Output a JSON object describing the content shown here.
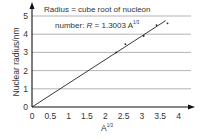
{
  "chart_data": {
    "type": "scatter",
    "title": "",
    "annotation_line1": "Radius = cube root of nucleon",
    "annotation_line2_prefix": "number: ",
    "annotation_var": "R",
    "annotation_eq": " = 1.3003 A",
    "annotation_sup": "1/3",
    "xlabel": "A",
    "xlabel_sup": "1/3",
    "ylabel": "Nuclear radius/nm",
    "xlim": [
      0,
      4
    ],
    "ylim": [
      0,
      5
    ],
    "xticks": [
      "0",
      "0.5",
      "1",
      "1.5",
      "2",
      "2.5",
      "3",
      "3.5",
      "4"
    ],
    "xtick_values": [
      0,
      0.5,
      1,
      1.5,
      2,
      2.5,
      3,
      3.5,
      4
    ],
    "yticks": [
      "0",
      "1",
      "2",
      "3",
      "4",
      "5"
    ],
    "ytick_values": [
      0,
      1,
      2,
      3,
      4,
      5
    ],
    "grid": "horizontal",
    "points": [
      {
        "x": 2.3,
        "y": 3.0
      },
      {
        "x": 2.55,
        "y": 3.45
      },
      {
        "x": 3.05,
        "y": 3.9
      },
      {
        "x": 3.4,
        "y": 4.5
      },
      {
        "x": 3.7,
        "y": 4.6
      }
    ],
    "fit_line": {
      "slope": 1.3003,
      "intercept": 0,
      "x_start": 0,
      "x_end": 3.65
    },
    "colors": {
      "axis": "#111111",
      "grid": "#a0a0a0",
      "line": "#222222",
      "point": "#222222",
      "text": "#333333"
    }
  }
}
